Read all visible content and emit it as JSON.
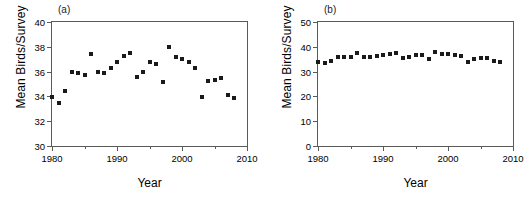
{
  "figure": {
    "panels": [
      {
        "id": "panel-a",
        "label": "(a)",
        "xlabel": "Year",
        "ylabel": "Mean Birds/Survey"
      },
      {
        "id": "panel-b",
        "label": "(b)",
        "xlabel": "Year",
        "ylabel": "Mean Birds/Survey"
      }
    ]
  },
  "chart_data": [
    {
      "type": "scatter",
      "panel": "(a)",
      "title": "",
      "xlabel": "Year",
      "ylabel": "Mean Birds/Survey",
      "xlim": [
        1980,
        2010
      ],
      "ylim": [
        30,
        40
      ],
      "xticks": [
        1980,
        1990,
        2000,
        2010
      ],
      "xticks_minor": [
        1985,
        1995,
        2005
      ],
      "yticks": [
        30,
        32,
        34,
        36,
        38,
        40
      ],
      "grid": false,
      "legend": null,
      "marker": "square",
      "marker_color": "#1a1a1a",
      "x": [
        1980,
        1981,
        1982,
        1983,
        1984,
        1985,
        1986,
        1987,
        1988,
        1989,
        1990,
        1991,
        1992,
        1993,
        1994,
        1995,
        1996,
        1997,
        1998,
        1999,
        2000,
        2001,
        2002,
        2003,
        2004,
        2005,
        2006,
        2007,
        2008
      ],
      "y": [
        33.95,
        33.5,
        34.45,
        36.0,
        35.85,
        35.75,
        37.4,
        36.0,
        35.85,
        36.3,
        36.8,
        37.25,
        37.5,
        35.6,
        36.0,
        36.8,
        36.6,
        35.15,
        38.0,
        37.2,
        37.0,
        36.8,
        36.3,
        33.95,
        35.25,
        35.35,
        35.45,
        34.1,
        33.85
      ]
    },
    {
      "type": "scatter",
      "panel": "(b)",
      "title": "",
      "xlabel": "Year",
      "ylabel": "Mean Birds/Survey",
      "xlim": [
        1980,
        2010
      ],
      "ylim": [
        0,
        50
      ],
      "xticks": [
        1980,
        1990,
        2000,
        2010
      ],
      "xticks_minor": [
        1985,
        1995,
        2005
      ],
      "yticks": [
        0,
        10,
        20,
        30,
        40,
        50
      ],
      "grid": false,
      "legend": null,
      "marker": "square",
      "marker_color": "#1a1a1a",
      "x": [
        1980,
        1981,
        1982,
        1983,
        1984,
        1985,
        1986,
        1987,
        1988,
        1989,
        1990,
        1991,
        1992,
        1993,
        1994,
        1995,
        1996,
        1997,
        1998,
        1999,
        2000,
        2001,
        2002,
        2003,
        2004,
        2005,
        2006,
        2007,
        2008
      ],
      "y": [
        33.95,
        33.5,
        34.45,
        36.0,
        35.85,
        35.75,
        37.4,
        36.0,
        35.85,
        36.3,
        36.8,
        37.25,
        37.5,
        35.6,
        36.0,
        36.8,
        36.6,
        35.15,
        38.0,
        37.2,
        37.0,
        36.8,
        36.3,
        33.95,
        35.25,
        35.35,
        35.45,
        34.1,
        33.85
      ]
    }
  ]
}
